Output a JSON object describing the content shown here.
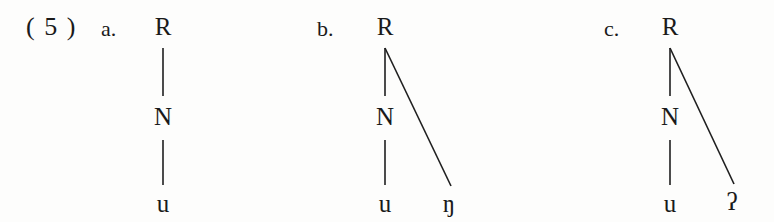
{
  "figure": {
    "example_number": "( 5 )",
    "background_color": "#fdfdfc",
    "ink_color": "#1a1a1a"
  },
  "structures": [
    {
      "label": "a.",
      "root": "R",
      "nucleus": "N",
      "nucleus_segment": "u",
      "coda_segment": "",
      "branching": false
    },
    {
      "label": "b.",
      "root": "R",
      "nucleus": "N",
      "nucleus_segment": "u",
      "coda_segment": "ŋ",
      "branching": true
    },
    {
      "label": "c.",
      "root": "R",
      "nucleus": "N",
      "nucleus_segment": "u",
      "coda_segment": "ʔ",
      "branching": true
    }
  ]
}
